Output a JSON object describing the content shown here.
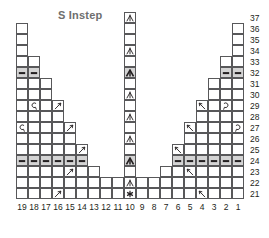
{
  "title": "S Instep",
  "colors": {
    "grid_line": "#58585a",
    "shaded_cell": "#d4d4d4",
    "symbol": "#231f20",
    "title": "#6e6e6e",
    "label": "#231f20",
    "background": "#ffffff"
  },
  "chart_data": {
    "type": "table",
    "title": "S Instep",
    "xlabel": "",
    "ylabel": "",
    "chart_kind": "knitting-stitch-chart",
    "columns": [
      19,
      18,
      17,
      16,
      15,
      14,
      13,
      12,
      11,
      10,
      9,
      8,
      7,
      6,
      5,
      4,
      3,
      2,
      1
    ],
    "rows": [
      37,
      36,
      35,
      34,
      33,
      32,
      31,
      30,
      29,
      28,
      27,
      26,
      25,
      24,
      23,
      22,
      21
    ],
    "legend": [
      {
        "symbol": "purl",
        "label": "purl stitch (dash)"
      },
      {
        "symbol": "k2tog",
        "label": "knit 2 together"
      },
      {
        "symbol": "ssk",
        "label": "slip slip knit"
      },
      {
        "symbol": "yo-left",
        "label": "yarn over left"
      },
      {
        "symbol": "yo-right",
        "label": "yarn over right"
      },
      {
        "symbol": "cdd",
        "label": "centered double decrease"
      },
      {
        "symbol": "cdd-bold",
        "label": "centered double decrease bold"
      },
      {
        "symbol": "star",
        "label": "no stitch / marker"
      },
      {
        "symbol": "blank",
        "label": "knit stitch"
      }
    ],
    "note": "Cells present per row form a stepped instep outline; column 10 is the center spine.",
    "cells": {
      "37": {
        "present": [
          10
        ],
        "symbols": {
          "10": "cdd"
        }
      },
      "36": {
        "present": [
          19,
          10,
          1
        ],
        "symbols": {}
      },
      "35": {
        "present": [
          19,
          10,
          1
        ],
        "symbols": {}
      },
      "34": {
        "present": [
          19,
          10,
          1
        ],
        "symbols": {
          "10": "cdd"
        }
      },
      "33": {
        "present": [
          19,
          18,
          10,
          2,
          1
        ],
        "symbols": {}
      },
      "32": {
        "present": [
          19,
          18,
          10,
          2,
          1
        ],
        "symbols": {
          "19": "purl",
          "18": "purl",
          "10": "cdd-bold",
          "2": "purl",
          "1": "purl"
        }
      },
      "31": {
        "present": [
          19,
          18,
          17,
          10,
          3,
          2,
          1
        ],
        "symbols": {}
      },
      "30": {
        "present": [
          19,
          18,
          17,
          10,
          3,
          2,
          1
        ],
        "symbols": {
          "10": "cdd"
        }
      },
      "29": {
        "present": [
          19,
          18,
          17,
          16,
          10,
          4,
          3,
          2,
          1
        ],
        "symbols": {
          "18": "yo-left",
          "16": "k2tog",
          "4": "ssk",
          "2": "yo-right"
        }
      },
      "28": {
        "present": [
          19,
          18,
          17,
          16,
          10,
          4,
          3,
          2,
          1
        ],
        "symbols": {
          "10": "cdd"
        }
      },
      "27": {
        "present": [
          19,
          18,
          17,
          16,
          15,
          10,
          5,
          4,
          3,
          2,
          1
        ],
        "symbols": {
          "19": "yo-left",
          "15": "k2tog",
          "5": "ssk",
          "1": "yo-right"
        }
      },
      "26": {
        "present": [
          19,
          18,
          17,
          16,
          15,
          10,
          5,
          4,
          3,
          2,
          1
        ],
        "symbols": {
          "10": "cdd"
        }
      },
      "25": {
        "present": [
          19,
          18,
          17,
          16,
          15,
          14,
          10,
          6,
          5,
          4,
          3,
          2,
          1
        ],
        "symbols": {
          "14": "k2tog",
          "6": "ssk"
        }
      },
      "24": {
        "present": [
          19,
          18,
          17,
          16,
          15,
          14,
          10,
          6,
          5,
          4,
          3,
          2,
          1
        ],
        "symbols": {
          "19": "purl",
          "18": "purl",
          "17": "purl",
          "16": "purl",
          "15": "purl",
          "14": "purl",
          "10": "cdd-bold",
          "6": "purl",
          "5": "purl",
          "4": "purl",
          "3": "purl",
          "2": "purl",
          "1": "purl"
        }
      },
      "23": {
        "present": [
          19,
          18,
          17,
          16,
          15,
          14,
          13,
          10,
          7,
          6,
          5,
          4,
          3,
          2,
          1
        ],
        "symbols": {
          "15": "k2tog",
          "5": "ssk"
        }
      },
      "22": {
        "present": [
          19,
          18,
          17,
          16,
          15,
          14,
          13,
          12,
          11,
          10,
          9,
          8,
          7,
          6,
          5,
          4,
          3,
          2,
          1
        ],
        "symbols": {
          "10": "cdd"
        }
      },
      "21": {
        "present": [
          19,
          18,
          17,
          16,
          15,
          14,
          13,
          12,
          11,
          10,
          9,
          8,
          7,
          6,
          5,
          4,
          3,
          2,
          1
        ],
        "symbols": {
          "16": "k2tog",
          "10": "star",
          "4": "ssk"
        }
      }
    }
  }
}
